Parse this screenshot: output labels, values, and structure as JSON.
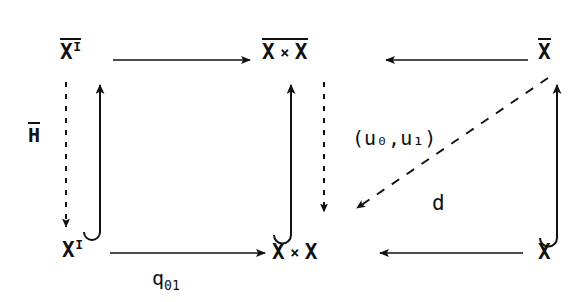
{
  "figure": {
    "kind": "commutative-diagram"
  },
  "nodes": {
    "top_left": {
      "base": "X",
      "exponent": "I",
      "overbar": true,
      "text": "X̅ᴵ"
    },
    "top_mid_left": {
      "base": "X",
      "overbar": true
    },
    "top_mid_times": {
      "symbol": "×"
    },
    "top_mid_right": {
      "base": "X",
      "overbar": true
    },
    "top_right": {
      "base": "X",
      "overbar": true
    },
    "bottom_left": {
      "base": "X",
      "exponent": "I",
      "overbar": false
    },
    "bottom_mid_left": {
      "base": "X"
    },
    "bottom_mid_times": {
      "symbol": "×"
    },
    "bottom_mid_right": {
      "base": "X"
    },
    "bottom_right": {
      "base": "X"
    }
  },
  "labels": {
    "left_vertical": {
      "base": "H",
      "overbar": true
    },
    "bottom_horizontal": {
      "base": "q",
      "sub": "01"
    },
    "diagonal_upper": {
      "text": "(u₀,u₁)",
      "open": "(",
      "u": "u",
      "sub0": "0",
      "comma": ",",
      "sub1": "1",
      "close": ")"
    },
    "diagonal_lower": {
      "text": "d"
    }
  },
  "colors": {
    "ink": "#111111",
    "background": "#ffffff"
  }
}
